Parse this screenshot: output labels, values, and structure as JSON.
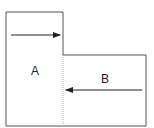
{
  "diagram": {
    "regions": [
      {
        "id": "A",
        "label": "A",
        "arrow_direction": "right"
      },
      {
        "id": "B",
        "label": "B",
        "arrow_direction": "left"
      }
    ],
    "colors": {
      "outline": "#555555",
      "divider": "#aaaaaa",
      "arrow": "#222222"
    }
  }
}
